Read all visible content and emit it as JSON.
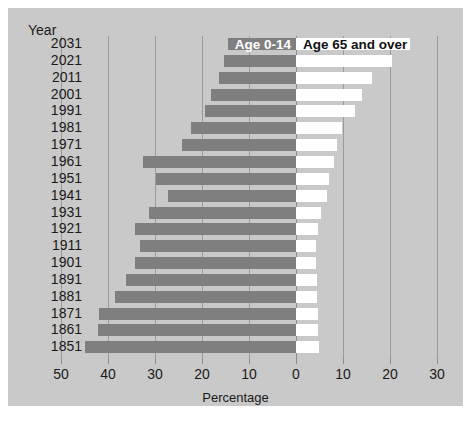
{
  "chart_data": {
    "type": "bar",
    "subtype": "population-pyramid",
    "title": "",
    "xlabel": "Percentage",
    "ylabel": "Year",
    "orientation": "horizontal",
    "grid": true,
    "legend_position": "top-center",
    "x_ticks_left": [
      "50",
      "40",
      "30",
      "20",
      "10",
      "0"
    ],
    "x_ticks_right": [
      "10",
      "20",
      "30"
    ],
    "xlim_left": 50,
    "xlim_right": 30,
    "categories": [
      "2031",
      "2021",
      "2011",
      "2001",
      "1991",
      "1981",
      "1971",
      "1961",
      "1951",
      "1941",
      "1931",
      "1921",
      "1911",
      "1901",
      "1891",
      "1881",
      "1871",
      "1861",
      "1851"
    ],
    "series": [
      {
        "name": "Age 0-14",
        "direction": "left",
        "color": "#7f7f7f",
        "values": [
          14.5,
          15.3,
          16.4,
          18.1,
          19.4,
          22.4,
          24.2,
          32.6,
          29.7,
          27.2,
          31.3,
          34.2,
          33.2,
          34.2,
          36.1,
          38.5,
          41.9,
          42.1,
          44.9
        ]
      },
      {
        "name": "Age 65 and over",
        "direction": "right",
        "color": "#ffffff",
        "values": [
          24.3,
          20.4,
          16.2,
          14.0,
          12.5,
          9.8,
          8.7,
          8.1,
          7.0,
          6.6,
          5.4,
          4.7,
          4.3,
          4.3,
          4.4,
          4.5,
          4.6,
          4.7,
          4.8
        ]
      }
    ],
    "legend": [
      {
        "label": "Age 0-14",
        "swatch": "#7f7f7f",
        "text_color": "#ffffff"
      },
      {
        "label": "Age 65 and over",
        "swatch": "#ffffff",
        "text_color": "#111111"
      }
    ],
    "background_color": "#c9c9c9",
    "gridline_color": "#9a9a9a"
  },
  "axis": {
    "year_header": "Year",
    "x_title": "Percentage"
  }
}
